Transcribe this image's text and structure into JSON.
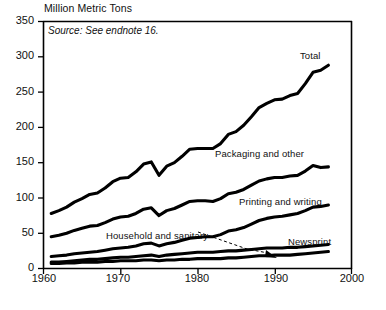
{
  "chart_data": {
    "type": "line",
    "title": "Million Metric Tons",
    "subtitle": "Source:  See endnote 16.",
    "xlabel": "",
    "ylabel": "Million Metric Tons",
    "xlim": [
      1960,
      2000
    ],
    "ylim": [
      0,
      350
    ],
    "grid": false,
    "legend_position": "inline-right",
    "xticks": [
      1960,
      1970,
      1980,
      1990,
      2000
    ],
    "yticks": [
      0,
      50,
      100,
      150,
      200,
      250,
      300,
      350
    ],
    "x": [
      1961,
      1962,
      1963,
      1964,
      1965,
      1966,
      1967,
      1968,
      1969,
      1970,
      1971,
      1972,
      1973,
      1974,
      1975,
      1976,
      1977,
      1978,
      1979,
      1980,
      1981,
      1982,
      1983,
      1984,
      1985,
      1986,
      1987,
      1988,
      1989,
      1990,
      1991,
      1992,
      1993,
      1994,
      1995,
      1996,
      1997
    ],
    "series": [
      {
        "name": "Total",
        "label": "Total",
        "values": [
          78,
          82,
          87,
          94,
          99,
          105,
          107,
          114,
          123,
          128,
          129,
          137,
          148,
          151,
          132,
          145,
          150,
          159,
          169,
          170,
          170,
          170,
          177,
          190,
          194,
          203,
          215,
          228,
          234,
          239,
          240,
          245,
          248,
          262,
          278,
          281,
          288
        ]
      },
      {
        "name": "Packaging and other",
        "label": "Packaging and other",
        "values": [
          45,
          47,
          50,
          54,
          57,
          60,
          61,
          65,
          70,
          73,
          74,
          78,
          84,
          86,
          75,
          82,
          85,
          90,
          95,
          96,
          96,
          95,
          99,
          106,
          108,
          112,
          118,
          124,
          127,
          129,
          129,
          131,
          132,
          138,
          146,
          143,
          144
        ]
      },
      {
        "name": "Printing and writing",
        "label": "Printing and writing",
        "values": [
          17,
          18,
          19,
          21,
          22,
          23,
          24,
          26,
          28,
          29,
          30,
          32,
          35,
          36,
          32,
          35,
          37,
          40,
          43,
          44,
          45,
          45,
          48,
          53,
          55,
          58,
          63,
          68,
          71,
          73,
          74,
          76,
          78,
          82,
          87,
          88,
          90
        ]
      },
      {
        "name": "Household and sanitary",
        "label": "Household and sanitary",
        "values": [
          9,
          9,
          10,
          11,
          12,
          13,
          13,
          14,
          15,
          16,
          16,
          17,
          18,
          19,
          17,
          19,
          20,
          21,
          22,
          23,
          23,
          23,
          24,
          25,
          25,
          26,
          27,
          28,
          29,
          29,
          29,
          30,
          30,
          31,
          32,
          33,
          34
        ]
      },
      {
        "name": "Newsprint",
        "label": "Newsprint",
        "values": [
          7,
          7,
          8,
          8,
          9,
          9,
          9,
          10,
          10,
          11,
          11,
          11,
          12,
          12,
          11,
          12,
          12,
          13,
          13,
          14,
          14,
          14,
          14,
          15,
          15,
          16,
          17,
          18,
          18,
          19,
          19,
          19,
          20,
          21,
          22,
          23,
          24
        ]
      }
    ],
    "annotations": [
      {
        "text": "Household and sanitary",
        "type": "leader-arrow",
        "points_to": "Household and sanitary series"
      }
    ]
  },
  "axis": {
    "y_tick_labels": [
      "350",
      "300",
      "250",
      "200",
      "150",
      "100",
      "50",
      "0"
    ],
    "x_tick_labels": [
      "1960",
      "1970",
      "1980",
      "1990",
      "2000"
    ]
  },
  "labels": {
    "total": "Total",
    "packaging": "Packaging and other",
    "printing": "Printing and writing",
    "household": "Household and sanitary",
    "newsprint": "Newsprint"
  },
  "colors": {
    "line": "#000000",
    "background": "#ffffff",
    "text": "#111111"
  }
}
